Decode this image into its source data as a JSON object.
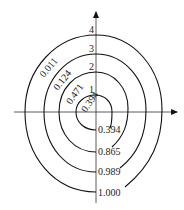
{
  "diagram": {
    "axes": {
      "x_arrow": true,
      "y_arrow": true
    },
    "curves": [
      {
        "index": "1",
        "start_label": "0.394",
        "arc_label": "0.394"
      },
      {
        "index": "2",
        "start_label": "0.865",
        "arc_label": "0.471"
      },
      {
        "index": "3",
        "start_label": "0.989",
        "arc_label": "0.124"
      },
      {
        "index": "4",
        "start_label": "1.000",
        "arc_label": "0.011"
      }
    ],
    "colors": {
      "line": "#111111",
      "axis": "#333333",
      "background": "#ffffff"
    }
  }
}
